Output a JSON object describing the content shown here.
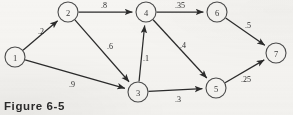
{
  "figure": {
    "caption": "Figure 6-5",
    "colors": {
      "background": "#f6f5f2",
      "node_stroke": "#4b4b4b",
      "edge_stroke": "#2b2b2b",
      "text": "#2b2b2b"
    }
  },
  "chart_data": {
    "type": "diagram",
    "title": "Figure 6-5",
    "subtype": "directed-weighted-network",
    "nodes": [
      {
        "id": "1",
        "label": "1",
        "x": 15,
        "y": 57,
        "r": 10
      },
      {
        "id": "2",
        "label": "2",
        "x": 68,
        "y": 12,
        "r": 10
      },
      {
        "id": "3",
        "label": "3",
        "x": 138,
        "y": 92,
        "r": 10
      },
      {
        "id": "4",
        "label": "4",
        "x": 146,
        "y": 12,
        "r": 10
      },
      {
        "id": "5",
        "label": "5",
        "x": 216,
        "y": 88,
        "r": 10
      },
      {
        "id": "6",
        "label": "6",
        "x": 217,
        "y": 12,
        "r": 10
      },
      {
        "id": "7",
        "label": "7",
        "x": 276,
        "y": 53,
        "r": 10
      }
    ],
    "edges": [
      {
        "from": "1",
        "to": "2",
        "weight": ".2",
        "value": 0.2,
        "lx": 41,
        "ly": 31
      },
      {
        "from": "1",
        "to": "3",
        "weight": ".9",
        "value": 0.9,
        "lx": 72,
        "ly": 84
      },
      {
        "from": "2",
        "to": "4",
        "weight": ".8",
        "value": 0.8,
        "lx": 104,
        "ly": 5
      },
      {
        "from": "2",
        "to": "3",
        "weight": ".6",
        "value": 0.6,
        "lx": 110,
        "ly": 46
      },
      {
        "from": "3",
        "to": "4",
        "weight": ".1",
        "value": 0.1,
        "lx": 146,
        "ly": 58
      },
      {
        "from": "3",
        "to": "5",
        "weight": ".3",
        "value": 0.3,
        "lx": 178,
        "ly": 99
      },
      {
        "from": "4",
        "to": "6",
        "weight": ".35",
        "value": 0.35,
        "lx": 180,
        "ly": 5
      },
      {
        "from": "4",
        "to": "5",
        "weight": ".4",
        "value": 0.4,
        "lx": 183,
        "ly": 45
      },
      {
        "from": "5",
        "to": "7",
        "weight": ".25",
        "value": 0.25,
        "lx": 246,
        "ly": 79
      },
      {
        "from": "6",
        "to": "7",
        "weight": ".5",
        "value": 0.5,
        "lx": 248,
        "ly": 25
      }
    ],
    "xlabel": "",
    "ylabel": "",
    "legend": []
  }
}
